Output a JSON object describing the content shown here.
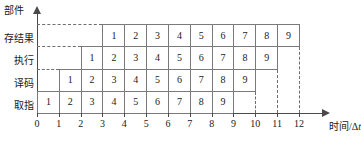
{
  "figure": {
    "title": "",
    "y_axis_title": "部件",
    "x_axis_title_main": "时间/Δ",
    "x_axis_title_italic": "t"
  },
  "chart_data": {
    "type": "bar",
    "title": "",
    "xlabel": "时间/Δt",
    "ylabel": "部件",
    "xlim": [
      0,
      12
    ],
    "xticks": [
      0,
      1,
      2,
      3,
      4,
      5,
      6,
      7,
      8,
      9,
      10,
      11,
      12
    ],
    "xtick_labels": [
      "0",
      "1",
      "2",
      "3",
      "4",
      "5",
      "6",
      "7",
      "8",
      "9",
      "10",
      "11",
      "12"
    ],
    "grid": false,
    "legend": "none",
    "categories": [
      "取指",
      "译码",
      "执行",
      "存结果"
    ],
    "series": [
      {
        "name": "取指",
        "row_index": 0,
        "start": 0,
        "end": 9,
        "cells": [
          {
            "label": "1",
            "start": 0,
            "end": 1
          },
          {
            "label": "2",
            "start": 1,
            "end": 2
          },
          {
            "label": "3",
            "start": 2,
            "end": 3
          },
          {
            "label": "4",
            "start": 3,
            "end": 4
          },
          {
            "label": "5",
            "start": 4,
            "end": 5
          },
          {
            "label": "6",
            "start": 5,
            "end": 6
          },
          {
            "label": "7",
            "start": 6,
            "end": 7
          },
          {
            "label": "8",
            "start": 7,
            "end": 8
          },
          {
            "label": "9",
            "start": 8,
            "end": 9
          }
        ]
      },
      {
        "name": "译码",
        "row_index": 1,
        "start": 1,
        "end": 10,
        "cells": [
          {
            "label": "1",
            "start": 1,
            "end": 2
          },
          {
            "label": "2",
            "start": 2,
            "end": 3
          },
          {
            "label": "3",
            "start": 3,
            "end": 4
          },
          {
            "label": "4",
            "start": 4,
            "end": 5
          },
          {
            "label": "5",
            "start": 5,
            "end": 6
          },
          {
            "label": "6",
            "start": 6,
            "end": 7
          },
          {
            "label": "7",
            "start": 7,
            "end": 8
          },
          {
            "label": "8",
            "start": 8,
            "end": 9
          },
          {
            "label": "9",
            "start": 9,
            "end": 10
          }
        ]
      },
      {
        "name": "执行",
        "row_index": 2,
        "start": 2,
        "end": 11,
        "cells": [
          {
            "label": "1",
            "start": 2,
            "end": 3
          },
          {
            "label": "2",
            "start": 3,
            "end": 4
          },
          {
            "label": "3",
            "start": 4,
            "end": 5
          },
          {
            "label": "4",
            "start": 5,
            "end": 6
          },
          {
            "label": "5",
            "start": 6,
            "end": 7
          },
          {
            "label": "6",
            "start": 7,
            "end": 8
          },
          {
            "label": "7",
            "start": 8,
            "end": 9
          },
          {
            "label": "8",
            "start": 9,
            "end": 10
          },
          {
            "label": "9",
            "start": 10,
            "end": 11
          }
        ]
      },
      {
        "name": "存结果",
        "row_index": 3,
        "start": 3,
        "end": 12,
        "cells": [
          {
            "label": "1",
            "start": 3,
            "end": 4
          },
          {
            "label": "2",
            "start": 4,
            "end": 5
          },
          {
            "label": "3",
            "start": 5,
            "end": 6
          },
          {
            "label": "4",
            "start": 6,
            "end": 7
          },
          {
            "label": "5",
            "start": 7,
            "end": 8
          },
          {
            "label": "6",
            "start": 8,
            "end": 9
          },
          {
            "label": "7",
            "start": 9,
            "end": 10
          },
          {
            "label": "8",
            "start": 10,
            "end": 11
          },
          {
            "label": "9",
            "start": 11,
            "end": 12
          }
        ]
      }
    ],
    "guides": {
      "horizontal_dashed_rows": [
        1,
        2,
        3
      ],
      "vertical_dashed_at": [
        10,
        11,
        12
      ]
    },
    "colors": {
      "line": "#4a4a4a",
      "cell_border": "#7a7a7a",
      "dash": "#6e6e6e",
      "text": "#1a1a1a",
      "background": "#ffffff"
    }
  }
}
